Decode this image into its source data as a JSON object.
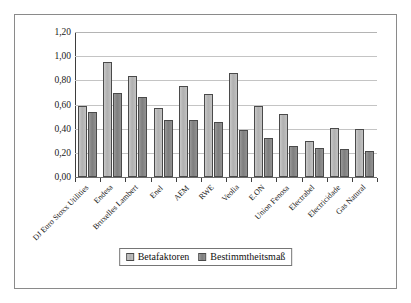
{
  "chart_data": {
    "type": "bar",
    "title": "",
    "subtitle": "",
    "xlabel": "",
    "ylabel": "",
    "ylim": [
      0.0,
      1.2
    ],
    "ytick_labels": [
      "0,00",
      "0,20",
      "0,40",
      "0,60",
      "0,80",
      "1,00",
      "1,20"
    ],
    "ytick_values": [
      0.0,
      0.2,
      0.4,
      0.6,
      0.8,
      1.0,
      1.2
    ],
    "grid": true,
    "grid_axis": "y",
    "legend_position": "bottom-center",
    "decimal_separator": ",",
    "categories": [
      "DJ Euro Stoxx Utilities",
      "Endesa",
      "Bruxelles Lambert",
      "Enel",
      "AEM",
      "RWE",
      "Veolia",
      "E.ON",
      "Union Fenosa",
      "Electrabel",
      "Electricidade",
      "Gas Natural"
    ],
    "series": [
      {
        "name": "Betafaktoren",
        "color": "#b8b8b8",
        "values": [
          0.59,
          0.955,
          0.835,
          0.57,
          0.75,
          0.69,
          0.86,
          0.585,
          0.525,
          0.3,
          0.405,
          0.4
        ]
      },
      {
        "name": "Bestimmtheitsmaß",
        "color": "#8a8a8a",
        "values": [
          0.54,
          0.695,
          0.66,
          0.475,
          0.47,
          0.455,
          0.39,
          0.325,
          0.26,
          0.24,
          0.235,
          0.215
        ]
      }
    ]
  },
  "legend": {
    "entries": [
      {
        "label": "Betafaktoren"
      },
      {
        "label": "Bestimmtheitsmaß"
      }
    ]
  },
  "colors": {
    "series_beta": "#b8b8b8",
    "series_r2": "#8a8a8a",
    "gridline": "#c4c4c4",
    "axis": "#3d3d3d",
    "frame": "#8a8a8a",
    "text": "#1a1a1a"
  }
}
